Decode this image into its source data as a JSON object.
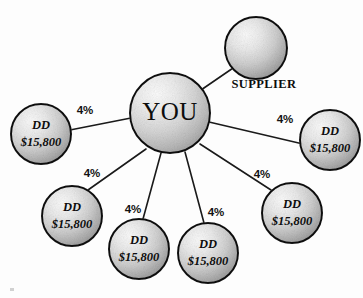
{
  "diagram": {
    "type": "hub-and-spoke",
    "background_color": "#fdfdfd",
    "outline_color": "#111111",
    "node_fill_light": "#f2f2f2",
    "node_fill_dark": "#9a9a9a",
    "center_node": {
      "id": "you",
      "label": "YOU",
      "cx": 170,
      "cy": 113,
      "r": 40
    },
    "nodes": [
      {
        "id": "supplier",
        "label": "",
        "outer_label": "SUPPLIER",
        "cx": 256,
        "cy": 48,
        "r": 31,
        "outer_label_x": 264,
        "outer_label_y": 85,
        "edge_percent": "",
        "pct_x": 0,
        "pct_y": 0
      },
      {
        "id": "dd-left",
        "line1": "DD",
        "line2": "$15,800",
        "cx": 41,
        "cy": 134,
        "r": 30,
        "edge_percent": "4%",
        "pct_x": 85,
        "pct_y": 111
      },
      {
        "id": "dd-right",
        "line1": "DD",
        "line2": "$15,800",
        "cx": 330,
        "cy": 140,
        "r": 30,
        "edge_percent": "4%",
        "pct_x": 285,
        "pct_y": 120
      },
      {
        "id": "dd-lower-left",
        "line1": "DD",
        "line2": "$15,800",
        "cx": 72,
        "cy": 216,
        "r": 30,
        "edge_percent": "4%",
        "pct_x": 92,
        "pct_y": 174
      },
      {
        "id": "dd-bottom-left-center",
        "line1": "DD",
        "line2": "$15,800",
        "cx": 139,
        "cy": 249,
        "r": 30,
        "edge_percent": "4%",
        "pct_x": 133,
        "pct_y": 210
      },
      {
        "id": "dd-bottom-right-center",
        "line1": "DD",
        "line2": "$15,800",
        "cx": 208,
        "cy": 253,
        "r": 30,
        "edge_percent": "4%",
        "pct_x": 216,
        "pct_y": 213
      },
      {
        "id": "dd-lower-right",
        "line1": "DD",
        "line2": "$15,800",
        "cx": 292,
        "cy": 213,
        "r": 30,
        "edge_percent": "4%",
        "pct_x": 262,
        "pct_y": 175
      }
    ],
    "edges": [
      {
        "id": "edge-supplier",
        "x1": 201,
        "y1": 90,
        "x2": 236,
        "y2": 66
      },
      {
        "id": "edge-dd-left",
        "x1": 131,
        "y1": 118,
        "x2": 70,
        "y2": 130
      },
      {
        "id": "edge-dd-right",
        "x1": 209,
        "y1": 122,
        "x2": 303,
        "y2": 144
      },
      {
        "id": "edge-dd-lower-left",
        "x1": 146,
        "y1": 149,
        "x2": 88,
        "y2": 190
      },
      {
        "id": "edge-dd-bottom-left-center",
        "x1": 161,
        "y1": 153,
        "x2": 143,
        "y2": 219
      },
      {
        "id": "edge-dd-bottom-right-center",
        "x1": 185,
        "y1": 152,
        "x2": 204,
        "y2": 223
      },
      {
        "id": "edge-dd-lower-right",
        "x1": 200,
        "y1": 144,
        "x2": 271,
        "y2": 190
      }
    ]
  }
}
